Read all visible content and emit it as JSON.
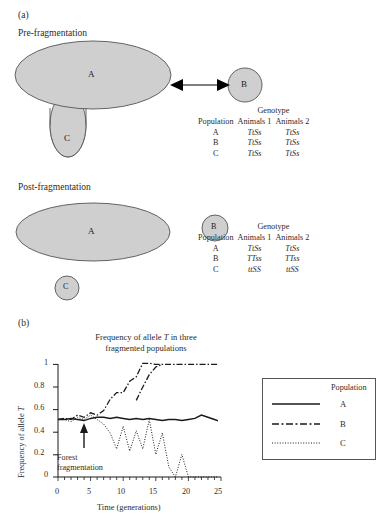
{
  "panels": {
    "a_label": "(a)",
    "b_label": "(b)"
  },
  "diagram": {
    "pre_label": "Pre-fragmentation",
    "post_label": "Post-fragmentation",
    "pre_shapes": [
      {
        "id": "A",
        "label": "A"
      },
      {
        "id": "B",
        "label": "B"
      },
      {
        "id": "C",
        "label": "C"
      }
    ],
    "post_shapes": [
      {
        "id": "A",
        "label": "A"
      },
      {
        "id": "B",
        "label": "B"
      },
      {
        "id": "C",
        "label": "C"
      }
    ],
    "shape_fill": "#cfcfcf",
    "shape_stroke": "#555555",
    "arrow_color": "#000000"
  },
  "tables": [
    {
      "name": "pre-fragmentation-genotypes",
      "group_header": "Genotype",
      "columns": [
        "Population",
        "Animals 1",
        "Animals 2"
      ],
      "rows": [
        {
          "population": "A",
          "animals_1": "TtSs",
          "animals_2": "TtSs"
        },
        {
          "population": "B",
          "animals_1": "TtSs",
          "animals_2": "TtSs"
        },
        {
          "population": "C",
          "animals_1": "TtSs",
          "animals_2": "TtSs"
        }
      ]
    },
    {
      "name": "post-fragmentation-genotypes",
      "group_header": "Genotype",
      "columns": [
        "Population",
        "Animals 1",
        "Animals 2"
      ],
      "rows": [
        {
          "population": "A",
          "animals_1": "TtSs",
          "animals_2": "TtSs"
        },
        {
          "population": "B",
          "animals_1": "TTss",
          "animals_2": "TTss"
        },
        {
          "population": "C",
          "animals_1": "ttSS",
          "animals_2": "ttSS"
        }
      ]
    }
  ],
  "chart_data": {
    "type": "line",
    "title": "Frequency of allele T in three fragmented populations",
    "title_line1": "Frequency of allele T in three",
    "title_line2": "fragmented populations",
    "xlabel": "Time (generations)",
    "ylabel": "Frequency of allele T",
    "xlim": [
      0,
      25
    ],
    "ylim": [
      0,
      1
    ],
    "xticks": [
      0,
      5,
      10,
      15,
      20,
      25
    ],
    "xtick_labels": [
      "0",
      "5",
      "10",
      "15",
      "20",
      "25"
    ],
    "yticks": [
      0,
      0.2,
      0.4,
      0.6,
      0.8,
      1
    ],
    "ytick_labels": [
      "0",
      "0.2",
      "0.4",
      "0.6",
      "0.8",
      "1"
    ],
    "minor_xtick_step": 1,
    "grid": false,
    "legend_position": "right",
    "legend_title": "Population",
    "annotation": {
      "text_line1": "Forest",
      "text_line2": "fragmentation",
      "arrow_at_x": 4,
      "arrow_at_y": 0.47
    },
    "x": [
      0,
      1,
      2,
      3,
      4,
      5,
      6,
      7,
      8,
      9,
      10,
      11,
      12,
      13,
      14,
      15,
      16,
      17,
      18,
      19,
      20,
      21,
      22,
      23,
      24,
      25
    ],
    "series": [
      {
        "name": "A",
        "style": "solid",
        "values": [
          0.49,
          0.49,
          0.5,
          0.49,
          0.48,
          0.5,
          0.51,
          0.51,
          0.5,
          0.51,
          0.5,
          0.49,
          0.5,
          0.49,
          0.5,
          0.49,
          0.48,
          0.49,
          0.49,
          0.48,
          0.49,
          0.5,
          0.53,
          0.51,
          0.49,
          0.47
        ]
      },
      {
        "name": "B",
        "style": "dash-dot",
        "values": [
          0.49,
          0.5,
          0.49,
          0.51,
          0.5,
          0.52,
          0.51,
          0.53,
          0.58,
          0.61,
          0.61,
          0.66,
          0.68,
          0.74,
          0.8,
          0.91,
          0.93,
          1.0,
          1.0,
          1.0,
          1.0,
          1.0,
          1.0,
          1.0,
          1.0,
          1.0
        ]
      },
      {
        "name": "C",
        "style": "dotted",
        "values": [
          0.49,
          0.49,
          0.48,
          0.5,
          0.49,
          0.51,
          0.49,
          0.47,
          0.43,
          0.36,
          0.46,
          0.24,
          0.33,
          0.25,
          0.38,
          0.1,
          0.31,
          0.16,
          0.0,
          0.1,
          0.0,
          0.0,
          0.0,
          0.0,
          0.0,
          0.0
        ]
      }
    ]
  }
}
